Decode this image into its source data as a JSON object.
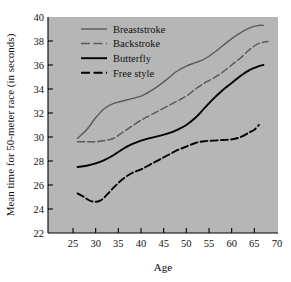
{
  "chart_data": {
    "type": "line",
    "title": "",
    "xlabel": "Age",
    "ylabel": "Mean time for 50-meter race (in seconds)",
    "xlim": [
      22.5,
      70
    ],
    "ylim": [
      22,
      40
    ],
    "xticks": [
      25,
      30,
      35,
      40,
      45,
      50,
      55,
      60,
      65,
      70
    ],
    "yticks": [
      22,
      24,
      26,
      28,
      30,
      32,
      34,
      36,
      38,
      40
    ],
    "grid": false,
    "legend_position": "top-left-inside",
    "plot_background": "#b6b6b6",
    "figure_background": "#ffffff",
    "series": [
      {
        "name": "Breaststroke",
        "color": "#5a5a5a",
        "style": "solid",
        "width": 1.4,
        "x": [
          26,
          28,
          30,
          32,
          34,
          36,
          38,
          40,
          42,
          44,
          46,
          48,
          50,
          52,
          54,
          56,
          58,
          60,
          62,
          64,
          66,
          67
        ],
        "y": [
          29.9,
          30.6,
          31.6,
          32.4,
          32.8,
          33.0,
          33.2,
          33.4,
          33.8,
          34.3,
          34.9,
          35.5,
          35.9,
          36.2,
          36.5,
          37.0,
          37.6,
          38.2,
          38.7,
          39.1,
          39.3,
          39.3
        ]
      },
      {
        "name": "Backstroke",
        "color": "#5a5a5a",
        "style": "dashed",
        "width": 1.5,
        "x": [
          26,
          28,
          30,
          32,
          34,
          36,
          38,
          40,
          42,
          44,
          46,
          48,
          50,
          52,
          54,
          56,
          58,
          60,
          62,
          64,
          66,
          68
        ],
        "y": [
          29.6,
          29.6,
          29.6,
          29.7,
          29.9,
          30.4,
          30.9,
          31.4,
          31.8,
          32.2,
          32.6,
          33.0,
          33.4,
          34.0,
          34.5,
          34.9,
          35.4,
          36.0,
          36.6,
          37.3,
          37.8,
          37.95
        ]
      },
      {
        "name": "Butterfly",
        "color": "#000000",
        "style": "solid",
        "width": 1.9,
        "x": [
          26,
          28,
          30,
          32,
          34,
          36,
          38,
          40,
          42,
          44,
          46,
          48,
          50,
          52,
          54,
          56,
          58,
          60,
          62,
          64,
          66,
          67
        ],
        "y": [
          27.5,
          27.6,
          27.8,
          28.1,
          28.5,
          29.0,
          29.4,
          29.7,
          29.9,
          30.1,
          30.3,
          30.6,
          31.0,
          31.6,
          32.4,
          33.2,
          33.9,
          34.5,
          35.1,
          35.6,
          35.9,
          36.0
        ]
      },
      {
        "name": "Free style",
        "color": "#000000",
        "style": "dashed",
        "width": 1.9,
        "x": [
          26,
          27,
          28,
          29,
          30,
          31,
          32,
          34,
          36,
          38,
          40,
          42,
          44,
          46,
          48,
          50,
          52,
          54,
          56,
          58,
          60,
          62,
          64,
          65,
          66
        ],
        "y": [
          25.3,
          25.1,
          24.85,
          24.65,
          24.6,
          24.7,
          25.0,
          25.8,
          26.5,
          27.0,
          27.3,
          27.7,
          28.1,
          28.5,
          28.9,
          29.2,
          29.5,
          29.65,
          29.7,
          29.75,
          29.8,
          30.0,
          30.4,
          30.6,
          31.0
        ]
      }
    ]
  },
  "legend": {
    "items": [
      {
        "label": "Breaststroke"
      },
      {
        "label": "Backstroke"
      },
      {
        "label": "Butterfly"
      },
      {
        "label": "Free style"
      }
    ]
  },
  "axes": {
    "x_title": "Age",
    "y_title": "Mean time for 50-meter race (in seconds)",
    "x_tick_labels": [
      "25",
      "30",
      "35",
      "40",
      "45",
      "50",
      "55",
      "60",
      "65",
      "70"
    ],
    "y_tick_labels": [
      "22",
      "24",
      "26",
      "28",
      "30",
      "32",
      "34",
      "36",
      "38",
      "40"
    ]
  }
}
